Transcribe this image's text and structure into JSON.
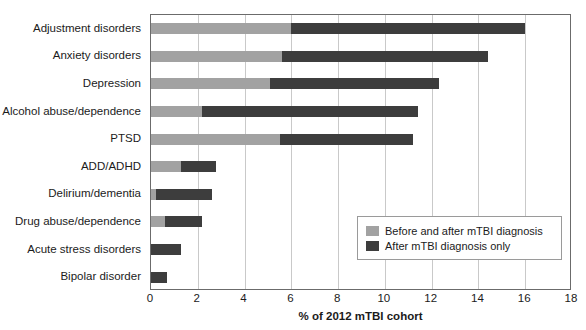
{
  "chart_data": {
    "type": "bar",
    "orientation": "horizontal",
    "stacked": true,
    "title": "",
    "xlabel": "% of 2012 mTBI cohort",
    "ylabel": "",
    "xlim": [
      0,
      18
    ],
    "xticks": [
      0,
      2,
      4,
      6,
      8,
      10,
      12,
      14,
      16,
      18
    ],
    "xtick_labels": [
      "0",
      "2",
      "4",
      "6",
      "8",
      "10",
      "12",
      "14",
      "16",
      "18"
    ],
    "grid": "vertical",
    "legend_position": "lower-right-inside",
    "categories": [
      "Adjustment disorders",
      "Anxiety disorders",
      "Depression",
      "Alcohol abuse/dependence",
      "PTSD",
      "ADD/ADHD",
      "Delirium/dementia",
      "Drug abuse/dependence",
      "Acute stress disorders",
      "Bipolar disorder"
    ],
    "series": [
      {
        "name": "Before and after mTBI diagnosis",
        "color": "#a2a2a2",
        "values": [
          6.0,
          5.6,
          5.1,
          2.2,
          5.5,
          1.3,
          0.2,
          0.6,
          0.0,
          0.0
        ]
      },
      {
        "name": "After mTBI diagnosis only",
        "color": "#3d3d3d",
        "values": [
          10.0,
          8.8,
          7.2,
          9.2,
          5.7,
          1.5,
          2.4,
          1.6,
          1.3,
          0.7
        ]
      }
    ],
    "totals": [
      16.0,
      14.4,
      12.3,
      11.4,
      11.2,
      2.8,
      2.6,
      2.2,
      1.3,
      0.7
    ]
  },
  "legend": {
    "items": [
      {
        "label": "Before and after mTBI diagnosis",
        "color": "#a2a2a2"
      },
      {
        "label": "After mTBI diagnosis only",
        "color": "#3d3d3d"
      }
    ]
  },
  "colors": {
    "before_and_after": "#a2a2a2",
    "after_only": "#3d3d3d",
    "gridline": "#c9c9c9",
    "axis": "#6b6b6b",
    "text": "#1b1b1b"
  }
}
